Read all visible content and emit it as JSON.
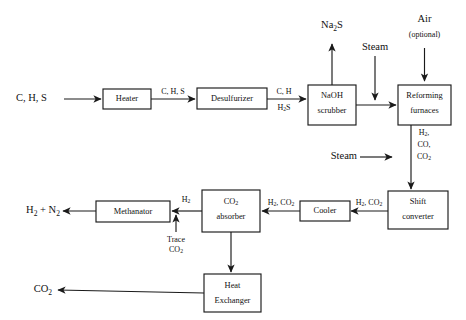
{
  "diagram": {
    "type": "process-flow-diagram",
    "background_color": "#ffffff",
    "line_color": "#1a1a1a",
    "unit_boxes": [
      {
        "id": "heater",
        "label_line1": "Heater",
        "label_line2": ""
      },
      {
        "id": "desulfurizer",
        "label_line1": "Desulfurizer",
        "label_line2": ""
      },
      {
        "id": "naoh-scrubber",
        "label_line1": "NaOH",
        "label_line2": "scrubber"
      },
      {
        "id": "reforming-furnaces",
        "label_line1": "Reforming",
        "label_line2": "furnaces"
      },
      {
        "id": "shift-converter",
        "label_line1": "Shift",
        "label_line2": "converter"
      },
      {
        "id": "cooler",
        "label_line1": "Cooler",
        "label_line2": ""
      },
      {
        "id": "co2-absorber",
        "label_line1": "CO2",
        "label_line2": "absorber"
      },
      {
        "id": "methanator",
        "label_line1": "Methanator",
        "label_line2": ""
      },
      {
        "id": "heat-exchanger",
        "label_line1": "Heat",
        "label_line2": "Exchanger"
      }
    ],
    "boxes": {
      "heater": "Heater",
      "desulfurizer": "Desulfurizer",
      "naoh_scrubber_l1": "NaOH",
      "naoh_scrubber_l2": "scrubber",
      "reforming_l1": "Reforming",
      "reforming_l2": "furnaces",
      "shift_l1": "Shift",
      "shift_l2": "converter",
      "cooler": "Cooler",
      "absorber_l2": "absorber",
      "methanator": "Methanator",
      "hx_l1": "Heat",
      "hx_l2": "Exchanger"
    },
    "io_streams": {
      "feed": "C, H, S",
      "na2s": "Na",
      "na2s_sub": "2",
      "na2s_tail": "S",
      "steam_top": "Steam",
      "air_l1": "Air",
      "air_l2": "(optional)",
      "steam_mid": "Steam",
      "product": "H",
      "product_sub": "2",
      "product_mid": " + N",
      "product_sub2": "2",
      "co2_out": "CO",
      "co2_out_sub": "2"
    },
    "stream_labels": {
      "heater_out": "C, H, S",
      "desulf_out_l1": "C, H",
      "desulf_out_l2_a": "H",
      "desulf_out_l2_sub": "2",
      "desulf_out_l2_b": "S",
      "reformer_out_l1_a": "H",
      "reformer_out_l1_sub": "2",
      "reformer_out_l1_b": ",",
      "reformer_out_l2": "CO,",
      "reformer_out_l3_a": "CO",
      "reformer_out_l3_sub": "2",
      "shift_out_a": "H",
      "shift_out_sub1": "2",
      "shift_out_b": ", CO",
      "shift_out_sub2": "2",
      "cooler_out_a": "H",
      "cooler_out_sub1": "2",
      "cooler_out_b": ", CO",
      "cooler_out_sub2": "2",
      "absorber_out_a": "H",
      "absorber_out_sub": "2",
      "trace_l1": "Trace",
      "trace_l2_a": "CO",
      "trace_l2_sub": "2"
    }
  }
}
